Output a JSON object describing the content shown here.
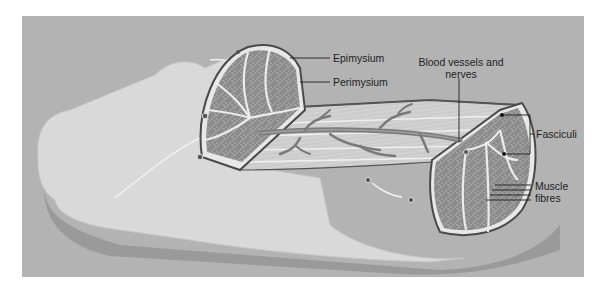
{
  "diagram": {
    "colors": {
      "background_panel": "#b3b3b3",
      "muscle_sheath": "#d9d9d9",
      "fascicle_fill": "#8c8c8c",
      "connective_tissue": "#e8e8e8",
      "outline": "#555555",
      "vessel": "#7a7a7a",
      "label_text": "#1e1e1e"
    },
    "labels": {
      "epimysium": "Epimysium",
      "perimysium": "Perimysium",
      "blood_vessels_line1": "Blood vessels and",
      "blood_vessels_line2": "nerves",
      "fasciculi": "Fasciculi",
      "muscle_fibres_line1": "Muscle",
      "muscle_fibres_line2": "fibres"
    }
  }
}
